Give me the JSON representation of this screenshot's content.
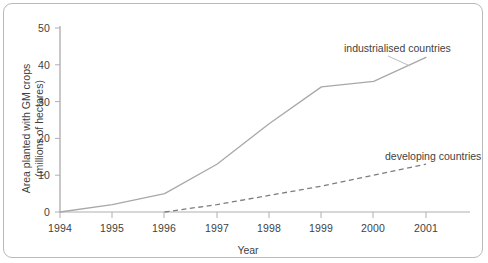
{
  "chart_data": {
    "type": "line",
    "title": "",
    "xlabel": "Year",
    "ylabel": "Area planted with GM crops (millions of hectares)",
    "ylabel_line1": "Area planted with GM crops",
    "ylabel_line2": "(millions of hectares)",
    "x": [
      1994,
      1995,
      1996,
      1997,
      1998,
      1999,
      2000,
      2001
    ],
    "xticklabels": [
      "1994",
      "1995",
      "1996",
      "1997",
      "1998",
      "1999",
      "2000",
      "2001"
    ],
    "yticks": [
      0,
      10,
      20,
      30,
      40,
      50
    ],
    "yticklabels": [
      "0",
      "10",
      "20",
      "30",
      "40",
      "50"
    ],
    "xlim": [
      1994,
      2001
    ],
    "ylim": [
      0,
      52
    ],
    "grid": false,
    "legend_position": "inline-annotations",
    "series": [
      {
        "name": "industrialised countries",
        "style": "solid",
        "color": "#a8a8a8",
        "values": [
          0,
          2,
          5,
          13,
          24,
          34,
          35.5,
          42
        ]
      },
      {
        "name": "developing countries",
        "style": "dashed",
        "color": "#7d7d7d",
        "x": [
          1996,
          1997,
          1998,
          1999,
          2000,
          2001
        ],
        "values": [
          0,
          2,
          4.5,
          7,
          10,
          13
        ]
      }
    ],
    "annotations": [
      {
        "text": "industrialised countries",
        "series": "industrialised countries"
      },
      {
        "text": "developing countries",
        "series": "developing countries"
      }
    ]
  }
}
